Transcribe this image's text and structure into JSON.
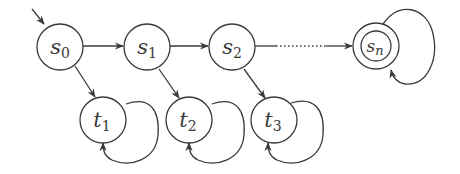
{
  "diagram": {
    "type": "state-transition",
    "colors": {
      "stroke": "#3a3a3a",
      "background": "#ffffff"
    },
    "initial_state": "s0",
    "states": [
      {
        "id": "s0",
        "base": "s",
        "sub": "0",
        "x": 60,
        "y": 47,
        "accepting": false
      },
      {
        "id": "s1",
        "base": "s",
        "sub": "1",
        "x": 147,
        "y": 47,
        "accepting": false
      },
      {
        "id": "s2",
        "base": "s",
        "sub": "2",
        "x": 232,
        "y": 47,
        "accepting": false
      },
      {
        "id": "sn",
        "base": "s",
        "sub": "n",
        "x": 376,
        "y": 47,
        "accepting": true
      },
      {
        "id": "t1",
        "base": "t",
        "sub": "1",
        "x": 103,
        "y": 120,
        "accepting": false
      },
      {
        "id": "t2",
        "base": "t",
        "sub": "2",
        "x": 189,
        "y": 120,
        "accepting": false
      },
      {
        "id": "t3",
        "base": "t",
        "sub": "3",
        "x": 274,
        "y": 120,
        "accepting": false
      }
    ],
    "transitions": [
      {
        "from": "s0",
        "to": "s1",
        "style": "solid"
      },
      {
        "from": "s1",
        "to": "s2",
        "style": "solid"
      },
      {
        "from": "s2",
        "to": "sn",
        "style": "dotted"
      },
      {
        "from": "s0",
        "to": "t1",
        "style": "solid"
      },
      {
        "from": "s1",
        "to": "t2",
        "style": "solid"
      },
      {
        "from": "s2",
        "to": "t3",
        "style": "solid"
      },
      {
        "from": "t1",
        "to": "t1",
        "style": "self-loop"
      },
      {
        "from": "t2",
        "to": "t2",
        "style": "self-loop"
      },
      {
        "from": "t3",
        "to": "t3",
        "style": "self-loop"
      },
      {
        "from": "sn",
        "to": "sn",
        "style": "self-loop"
      }
    ],
    "labels": {
      "s0": {
        "base": "s",
        "sub": "0"
      },
      "s1": {
        "base": "s",
        "sub": "1"
      },
      "s2": {
        "base": "s",
        "sub": "2"
      },
      "sn": {
        "base": "s",
        "sub": "n"
      },
      "t1": {
        "base": "t",
        "sub": "1"
      },
      "t2": {
        "base": "t",
        "sub": "2"
      },
      "t3": {
        "base": "t",
        "sub": "3"
      }
    }
  }
}
